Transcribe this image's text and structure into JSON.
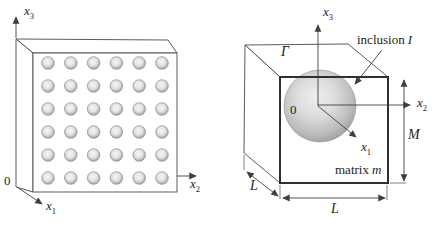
{
  "colors": {
    "ink": "#3f3f3f",
    "bold_edge": "#2f2f2f",
    "sphere_edge": "#8f8f8f",
    "fiber_edge": "#8f8f8f"
  },
  "left_figure": {
    "origin_label": "0",
    "axes": {
      "x1": {
        "base": "x",
        "sub": "1"
      },
      "x2": {
        "base": "x",
        "sub": "2"
      },
      "x3": {
        "base": "x",
        "sub": "3"
      }
    },
    "inclusion_grid": {
      "rows": 6,
      "cols": 6
    }
  },
  "right_figure": {
    "origin_label": "0",
    "axes": {
      "x1": {
        "base": "x",
        "sub": "1"
      },
      "x2": {
        "base": "x",
        "sub": "2"
      },
      "x3": {
        "base": "x",
        "sub": "3"
      }
    },
    "boundary_label": "Γ",
    "inclusion_label": {
      "word": "inclusion",
      "symbol": "I"
    },
    "matrix_label": {
      "word": "matrix",
      "symbol": "m"
    },
    "dims": {
      "height": "M",
      "width": "L",
      "depth": "L"
    }
  }
}
